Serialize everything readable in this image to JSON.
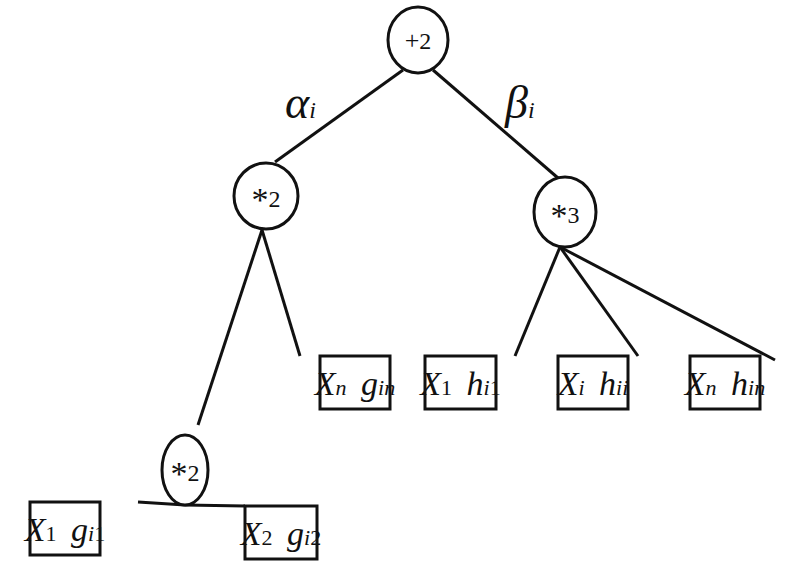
{
  "diagram": {
    "type": "tree",
    "edge_labels": [
      {
        "id": "alpha",
        "text": "α",
        "sub": "i",
        "x": 285,
        "y": 118
      },
      {
        "id": "beta",
        "text": "β",
        "sub": "i",
        "x": 505,
        "y": 118
      }
    ],
    "nodes": [
      {
        "id": "root",
        "op": "+",
        "arity": "2",
        "cx": 418,
        "cy": 40,
        "rx": 30,
        "ry": 33
      },
      {
        "id": "mul_left",
        "op": "*",
        "arity": "2",
        "cx": 262,
        "cy": 196,
        "rx": 32,
        "ry": 34
      },
      {
        "id": "mul_right",
        "op": "*",
        "arity": "3",
        "cx": 565,
        "cy": 212,
        "rx": 31,
        "ry": 35
      },
      {
        "id": "mul_inner",
        "op": "*",
        "arity": "2",
        "cx": 121,
        "cy": 390,
        "rx": 22,
        "ry": 35
      }
    ],
    "leaves": [
      {
        "id": "leaf_x1_gi1",
        "var": "X",
        "var_sub": "1",
        "w": "g",
        "w_sub": "i1",
        "x": 21,
        "y": 502,
        "width": 70,
        "height": 53
      },
      {
        "id": "leaf_x2_gi2",
        "var": "X",
        "var_sub": "2",
        "w": "g",
        "w_sub": "i2",
        "x": 244,
        "y": 506,
        "width": 72,
        "height": 53
      },
      {
        "id": "leaf_xn_gin",
        "var": "X",
        "var_sub": "n",
        "w": "g",
        "w_sub": "in",
        "x": 195,
        "y": 356,
        "width": 70,
        "height": 53
      },
      {
        "id": "leaf_x1_hi1",
        "var": "X",
        "var_sub": "1",
        "w": "h",
        "w_sub": "i1",
        "x": 273,
        "y": 356,
        "width": 70,
        "height": 53
      },
      {
        "id": "leaf_xi_hii",
        "var": "X",
        "var_sub": "i",
        "w": "h",
        "w_sub": "ii",
        "x": 356,
        "y": 356,
        "width": 69,
        "height": 53
      },
      {
        "id": "leaf_xn_hin",
        "var": "X",
        "var_sub": "n",
        "w": "h",
        "w_sub": "in",
        "x": 440,
        "y": 356,
        "width": 70,
        "height": 53
      }
    ],
    "edges": [
      {
        "from": "root",
        "to": "mul_left",
        "x1": 406,
        "y1": 70,
        "x2": 278,
        "y2": 160
      },
      {
        "from": "root",
        "to": "mul_right",
        "x1": 430,
        "y1": 70,
        "x2": 557,
        "y2": 177
      },
      {
        "from": "mul_left",
        "to": "mul_inner",
        "x1": 262,
        "y1": 230,
        "x2": 124,
        "y2": 356
      },
      {
        "from": "mul_left",
        "to": "leaf_xn_gin",
        "x1": 262,
        "y1": 230,
        "x2": 198,
        "y2": 356
      },
      {
        "from": "mul_right",
        "to": "leaf_x1_hi1",
        "x1": 565,
        "y1": 247,
        "x2": 339,
        "y2": 356
      },
      {
        "from": "mul_right",
        "to": "leaf_xi_hii",
        "x1": 565,
        "y1": 247,
        "x2": 421,
        "y2": 356
      },
      {
        "from": "mul_right",
        "to": "leaf_xn_hin",
        "x1": 565,
        "y1": 247,
        "x2": 508,
        "y2": 356
      },
      {
        "from": "mul_inner",
        "to": "leaf_x1_gi1",
        "x1": 121,
        "y1": 425,
        "x2": 88,
        "y2": 502
      },
      {
        "from": "mul_inner",
        "to": "leaf_x2_gi2",
        "x1": 121,
        "y1": 425,
        "x2": 158,
        "y2": 506
      }
    ]
  }
}
